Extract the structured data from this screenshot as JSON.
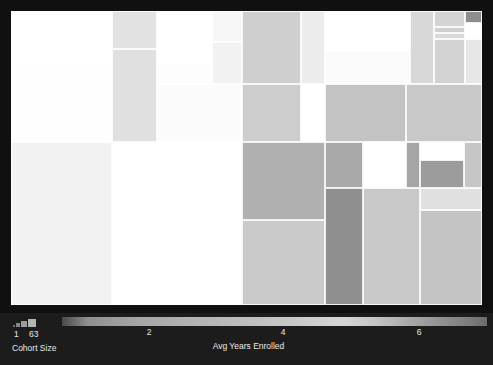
{
  "chart_data": {
    "type": "treemap",
    "title": "",
    "size_encoding": "Cohort Size",
    "color_encoding": "Avg Years Enrolled",
    "size_legend": {
      "label": "Cohort Size",
      "min": "1",
      "max": "63"
    },
    "color_legend": {
      "label": "Avg Years Enrolled",
      "ticks": [
        "2",
        "4",
        "6"
      ],
      "tick_positions_pct": [
        20.5,
        52.0,
        84.0
      ],
      "domain": [
        1.2,
        7.0
      ],
      "colormap": "grayscale-light-peak"
    },
    "grid": false,
    "legend_position": "bottom",
    "background": "#1c1c1c",
    "tiles": [
      {
        "x": 0.0,
        "y": 0.0,
        "w": 21.4,
        "h": 18.0,
        "color": "#ffffff",
        "value": 4.5,
        "size": 52
      },
      {
        "x": 0.0,
        "y": 18.0,
        "w": 21.4,
        "h": 26.6,
        "color": "#fefefe",
        "value": 4.4,
        "size": 63
      },
      {
        "x": 21.4,
        "y": 0.0,
        "w": 9.6,
        "h": 12.8,
        "color": "#e2e2e2",
        "value": 3.1,
        "size": 30
      },
      {
        "x": 21.4,
        "y": 12.8,
        "w": 9.6,
        "h": 31.8,
        "color": "#e0e0e0",
        "value": 3.0,
        "size": 36
      },
      {
        "x": 31.0,
        "y": 0.0,
        "w": 11.7,
        "h": 17.6,
        "color": "#ffffff",
        "value": 4.7,
        "size": 33
      },
      {
        "x": 31.0,
        "y": 17.6,
        "w": 11.7,
        "h": 7.2,
        "color": "#fdfdfd",
        "value": 4.6,
        "size": 14
      },
      {
        "x": 42.7,
        "y": 0.0,
        "w": 6.3,
        "h": 10.4,
        "color": "#f7f7f7",
        "value": 4.2,
        "size": 17
      },
      {
        "x": 42.7,
        "y": 10.4,
        "w": 6.3,
        "h": 14.4,
        "color": "#f2f2f2",
        "value": 4.0,
        "size": 19
      },
      {
        "x": 31.0,
        "y": 24.8,
        "w": 17.9,
        "h": 19.8,
        "color": "#fbfbfb",
        "value": 4.5,
        "size": 40
      },
      {
        "x": 49.0,
        "y": 0.0,
        "w": 12.6,
        "h": 24.8,
        "color": "#cfcfcf",
        "value": 2.6,
        "size": 41
      },
      {
        "x": 49.0,
        "y": 24.8,
        "w": 12.6,
        "h": 19.8,
        "color": "#cdcdcd",
        "value": 2.5,
        "size": 34
      },
      {
        "x": 61.6,
        "y": 0.0,
        "w": 5.0,
        "h": 24.8,
        "color": "#ececec",
        "value": 3.7,
        "size": 16
      },
      {
        "x": 66.6,
        "y": 0.0,
        "w": 18.2,
        "h": 13.6,
        "color": "#ffffff",
        "value": 5.0,
        "size": 38
      },
      {
        "x": 66.6,
        "y": 13.6,
        "w": 18.2,
        "h": 11.2,
        "color": "#fafafa",
        "value": 4.8,
        "size": 30
      },
      {
        "x": 84.8,
        "y": 0.0,
        "w": 5.0,
        "h": 24.8,
        "color": "#d8d8d8",
        "value": 2.8,
        "size": 18
      },
      {
        "x": 89.8,
        "y": 0.0,
        "w": 6.5,
        "h": 5.6,
        "color": "#d4d4d4",
        "value": 2.7,
        "size": 9
      },
      {
        "x": 89.8,
        "y": 5.6,
        "w": 6.5,
        "h": 2.0,
        "color": "#d0d0d0",
        "value": 2.6,
        "size": 5
      },
      {
        "x": 89.8,
        "y": 7.6,
        "w": 6.5,
        "h": 2.0,
        "color": "#d9d9d9",
        "value": 2.9,
        "size": 5
      },
      {
        "x": 89.8,
        "y": 9.6,
        "w": 6.5,
        "h": 15.2,
        "color": "#d2d2d2",
        "value": 2.6,
        "size": 20
      },
      {
        "x": 96.3,
        "y": 0.0,
        "w": 3.7,
        "h": 4.0,
        "color": "#8d8d8d",
        "value": 1.6,
        "size": 4
      },
      {
        "x": 96.3,
        "y": 4.0,
        "w": 3.7,
        "h": 5.6,
        "color": "#ffffff",
        "value": 5.2,
        "size": 6
      },
      {
        "x": 96.3,
        "y": 9.6,
        "w": 3.7,
        "h": 15.2,
        "color": "#e6e6e6",
        "value": 3.4,
        "size": 13
      },
      {
        "x": 49.0,
        "y": 44.6,
        "w": 17.6,
        "h": 26.4,
        "color": "#b0b0b0",
        "value": 2.1,
        "size": 48
      },
      {
        "x": 66.6,
        "y": 24.8,
        "w": 17.3,
        "h": 19.8,
        "color": "#c3c3c3",
        "value": 2.4,
        "size": 36
      },
      {
        "x": 83.9,
        "y": 24.8,
        "w": 16.1,
        "h": 19.8,
        "color": "#c8c8c8",
        "value": 2.5,
        "size": 34
      },
      {
        "x": 0.0,
        "y": 44.6,
        "w": 21.4,
        "h": 55.4,
        "color": "#f2f2f2",
        "value": 4.0,
        "size": 60
      },
      {
        "x": 21.4,
        "y": 44.6,
        "w": 21.9,
        "h": 28.6,
        "color": "#ffffff",
        "value": 5.0,
        "size": 47
      },
      {
        "x": 21.4,
        "y": 73.2,
        "w": 21.9,
        "h": 26.8,
        "color": "#ffffff",
        "value": 5.1,
        "size": 45
      },
      {
        "x": 43.3,
        "y": 44.6,
        "w": 5.7,
        "h": 55.4,
        "color": "#ffffff",
        "value": 5.0,
        "size": 20
      },
      {
        "x": 66.6,
        "y": 44.6,
        "w": 8.2,
        "h": 15.6,
        "color": "#a9a9a9",
        "value": 2.0,
        "size": 18
      },
      {
        "x": 74.8,
        "y": 44.6,
        "w": 9.1,
        "h": 15.6,
        "color": "#ffffff",
        "value": 5.0,
        "size": 20
      },
      {
        "x": 83.9,
        "y": 44.6,
        "w": 2.9,
        "h": 15.6,
        "color": "#a5a5a5",
        "value": 1.9,
        "size": 7
      },
      {
        "x": 86.8,
        "y": 44.6,
        "w": 9.4,
        "h": 6.2,
        "color": "#ffffff",
        "value": 5.3,
        "size": 12
      },
      {
        "x": 86.8,
        "y": 50.8,
        "w": 9.4,
        "h": 9.4,
        "color": "#9c9c9c",
        "value": 1.8,
        "size": 14
      },
      {
        "x": 96.2,
        "y": 44.6,
        "w": 3.8,
        "h": 15.6,
        "color": "#c6c6c6",
        "value": 2.4,
        "size": 9
      },
      {
        "x": 86.8,
        "y": 60.2,
        "w": 13.2,
        "h": 7.6,
        "color": "#e0e0e0",
        "value": 3.1,
        "size": 15
      },
      {
        "x": 49.0,
        "y": 71.0,
        "w": 17.6,
        "h": 29.0,
        "color": "#cacaca",
        "value": 2.5,
        "size": 42
      },
      {
        "x": 66.6,
        "y": 60.2,
        "w": 8.2,
        "h": 39.8,
        "color": "#8f8f8f",
        "value": 1.7,
        "size": 41
      },
      {
        "x": 74.8,
        "y": 60.2,
        "w": 12.0,
        "h": 39.8,
        "color": "#c8c8c8",
        "value": 2.5,
        "size": 40
      },
      {
        "x": 86.8,
        "y": 67.8,
        "w": 13.2,
        "h": 32.2,
        "color": "#c4c4c4",
        "value": 2.4,
        "size": 38
      }
    ]
  },
  "legend": {
    "size": {
      "title": "Cohort Size",
      "min_label": "1",
      "max_label": "63"
    },
    "color": {
      "title": "Avg Years Enrolled",
      "ticks": [
        "2",
        "4",
        "6"
      ]
    }
  }
}
